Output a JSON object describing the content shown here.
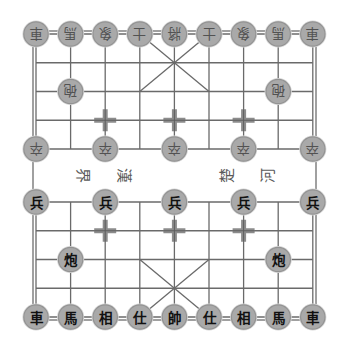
{
  "game": "xiangqi",
  "colors": {
    "background": "#ffffff",
    "grid_line": "#6a6a6a",
    "border_line": "#6e6e6e",
    "marker": "#8c8c8c",
    "piece_fill": "#a9a9a9",
    "piece_edge": "#939393",
    "piece_halo": "#d6d6d6",
    "black_text": "#525252",
    "red_text": "#111111"
  },
  "board": {
    "files": 9,
    "ranks": 10,
    "river_text": [
      "界",
      "漢",
      "楚",
      "河"
    ],
    "palaces": [
      {
        "from_file": 3,
        "to_file": 5,
        "from_rank": 0,
        "to_rank": 2
      },
      {
        "from_file": 3,
        "to_file": 5,
        "from_rank": 7,
        "to_rank": 9
      }
    ],
    "markers": [
      {
        "file": 2,
        "rank": 3
      },
      {
        "file": 4,
        "rank": 3
      },
      {
        "file": 6,
        "rank": 3
      },
      {
        "file": 2,
        "rank": 6
      },
      {
        "file": 4,
        "rank": 6
      },
      {
        "file": 6,
        "rank": 6
      }
    ]
  },
  "pieces": [
    {
      "side": "black",
      "name": "chariot",
      "char": "車",
      "file": 0,
      "rank": 0
    },
    {
      "side": "black",
      "name": "horse",
      "char": "馬",
      "file": 1,
      "rank": 0
    },
    {
      "side": "black",
      "name": "elephant",
      "char": "象",
      "file": 2,
      "rank": 0
    },
    {
      "side": "black",
      "name": "advisor",
      "char": "士",
      "file": 3,
      "rank": 0
    },
    {
      "side": "black",
      "name": "general",
      "char": "將",
      "file": 4,
      "rank": 0
    },
    {
      "side": "black",
      "name": "advisor",
      "char": "士",
      "file": 5,
      "rank": 0
    },
    {
      "side": "black",
      "name": "elephant",
      "char": "象",
      "file": 6,
      "rank": 0
    },
    {
      "side": "black",
      "name": "horse",
      "char": "馬",
      "file": 7,
      "rank": 0
    },
    {
      "side": "black",
      "name": "chariot",
      "char": "車",
      "file": 8,
      "rank": 0
    },
    {
      "side": "black",
      "name": "cannon",
      "char": "砲",
      "file": 1,
      "rank": 2
    },
    {
      "side": "black",
      "name": "cannon",
      "char": "砲",
      "file": 7,
      "rank": 2
    },
    {
      "side": "black",
      "name": "soldier",
      "char": "卒",
      "file": 0,
      "rank": 4
    },
    {
      "side": "black",
      "name": "soldier",
      "char": "卒",
      "file": 2,
      "rank": 4
    },
    {
      "side": "black",
      "name": "soldier",
      "char": "卒",
      "file": 4,
      "rank": 4
    },
    {
      "side": "black",
      "name": "soldier",
      "char": "卒",
      "file": 6,
      "rank": 4
    },
    {
      "side": "black",
      "name": "soldier",
      "char": "卒",
      "file": 8,
      "rank": 4
    },
    {
      "side": "red",
      "name": "soldier",
      "char": "兵",
      "file": 0,
      "rank": 5
    },
    {
      "side": "red",
      "name": "soldier",
      "char": "兵",
      "file": 2,
      "rank": 5
    },
    {
      "side": "red",
      "name": "soldier",
      "char": "兵",
      "file": 4,
      "rank": 5
    },
    {
      "side": "red",
      "name": "soldier",
      "char": "兵",
      "file": 6,
      "rank": 5
    },
    {
      "side": "red",
      "name": "soldier",
      "char": "兵",
      "file": 8,
      "rank": 5
    },
    {
      "side": "red",
      "name": "cannon",
      "char": "炮",
      "file": 1,
      "rank": 7
    },
    {
      "side": "red",
      "name": "cannon",
      "char": "炮",
      "file": 7,
      "rank": 7
    },
    {
      "side": "red",
      "name": "chariot",
      "char": "車",
      "file": 0,
      "rank": 9
    },
    {
      "side": "red",
      "name": "horse",
      "char": "馬",
      "file": 1,
      "rank": 9
    },
    {
      "side": "red",
      "name": "elephant",
      "char": "相",
      "file": 2,
      "rank": 9
    },
    {
      "side": "red",
      "name": "advisor",
      "char": "仕",
      "file": 3,
      "rank": 9
    },
    {
      "side": "red",
      "name": "general",
      "char": "帥",
      "file": 4,
      "rank": 9
    },
    {
      "side": "red",
      "name": "advisor",
      "char": "仕",
      "file": 5,
      "rank": 9
    },
    {
      "side": "red",
      "name": "elephant",
      "char": "相",
      "file": 6,
      "rank": 9
    },
    {
      "side": "red",
      "name": "horse",
      "char": "馬",
      "file": 7,
      "rank": 9
    },
    {
      "side": "red",
      "name": "chariot",
      "char": "車",
      "file": 8,
      "rank": 9
    }
  ]
}
